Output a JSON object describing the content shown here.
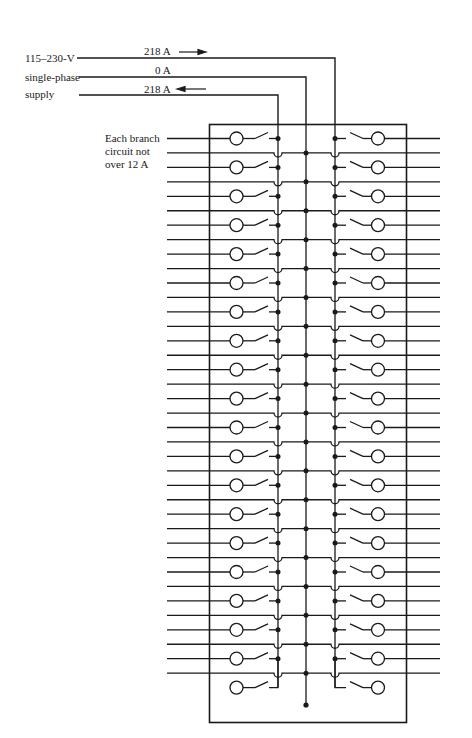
{
  "supply": {
    "labels": [
      "115–230-V",
      "single-phase",
      "supply"
    ],
    "lines": [
      {
        "name": "hot-line-1",
        "current": "218 A",
        "arrow": "right"
      },
      {
        "name": "neutral-line",
        "current": "0 A",
        "arrow": "none"
      },
      {
        "name": "hot-line-2",
        "current": "218 A",
        "arrow": "left"
      }
    ]
  },
  "branch_note": {
    "lines": [
      "Each branch",
      "circuit not",
      "over 12 A"
    ]
  },
  "panel": {
    "breaker_rows_per_side": 20,
    "total_breakers": 40,
    "neutral_taps": 19,
    "bus_bars": [
      "left hot bus",
      "neutral bus",
      "right hot bus"
    ]
  },
  "colors": {
    "line": "#1a1a1a",
    "background": "#ffffff"
  }
}
